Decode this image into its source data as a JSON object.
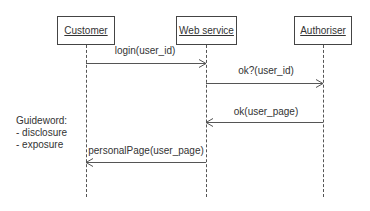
{
  "diagram": {
    "type": "sequence",
    "lifelines": [
      {
        "id": "customer",
        "label": "Customer"
      },
      {
        "id": "webservice",
        "label": "Web service"
      },
      {
        "id": "authoriser",
        "label": "Authoriser"
      }
    ],
    "messages": [
      {
        "from": "customer",
        "to": "webservice",
        "label": "login(user_id)",
        "kind": "sync"
      },
      {
        "from": "webservice",
        "to": "authoriser",
        "label": "ok?(user_id)",
        "kind": "sync"
      },
      {
        "from": "authoriser",
        "to": "webservice",
        "label": "ok(user_page)",
        "kind": "reply"
      },
      {
        "from": "webservice",
        "to": "customer",
        "label": "personalPage(user_page)",
        "kind": "reply"
      }
    ],
    "note": {
      "title": "Guideword:",
      "items": [
        "- disclosure",
        "- exposure"
      ]
    },
    "colors": {
      "line": "#555555",
      "text": "#333333",
      "background": "#ffffff"
    }
  }
}
